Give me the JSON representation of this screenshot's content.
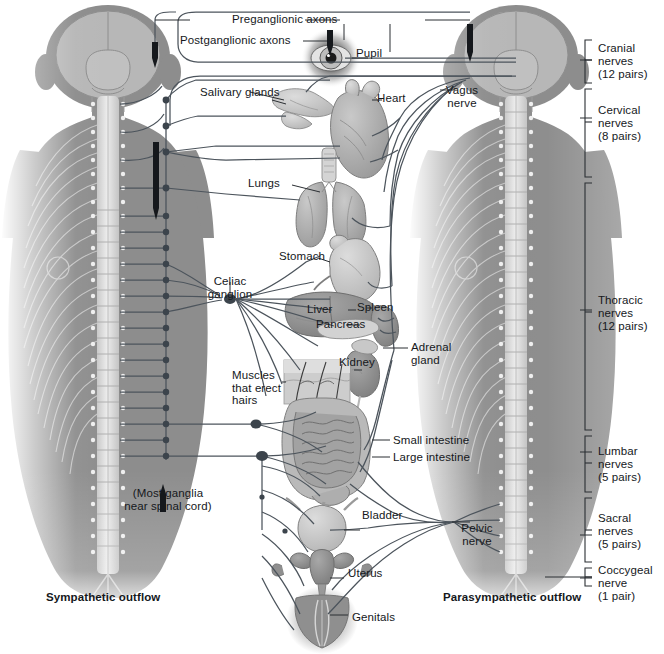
{
  "figure": {
    "title_left": "Sympathetic outflow",
    "title_right": "Parasympathetic outflow",
    "legend": {
      "preganglionic": "Preganglionic axons",
      "postganglionic": "Postganglionic axons"
    },
    "note_left": "(Most ganglia\nnear spinal cord)",
    "colors": {
      "body_fill": "#8d8d8d",
      "body_fill_light": "#b9b9b9",
      "brain_fill": "#b4b4b4",
      "cord_fill": "#d8d8d8",
      "nerve_line": "#4c545c",
      "ganglion_dot": "#3c444c",
      "organ_mid": "#a5a5a5",
      "organ_dark": "#8a8a8a",
      "organ_light": "#c6c6c6",
      "text": "#15181c",
      "background": "#ffffff"
    }
  },
  "organs": [
    {
      "id": "pupil",
      "label": "Pupil"
    },
    {
      "id": "salivary-glands",
      "label": "Salivary glands"
    },
    {
      "id": "heart",
      "label": "Heart"
    },
    {
      "id": "lungs",
      "label": "Lungs"
    },
    {
      "id": "stomach",
      "label": "Stomach"
    },
    {
      "id": "liver",
      "label": "Liver"
    },
    {
      "id": "spleen",
      "label": "Spleen"
    },
    {
      "id": "pancreas",
      "label": "Pancreas"
    },
    {
      "id": "kidney",
      "label": "Kidney"
    },
    {
      "id": "adrenal-gland",
      "label": "Adrenal\ngland"
    },
    {
      "id": "erector-muscles",
      "label": "Muscles\nthat erect\nhairs"
    },
    {
      "id": "small-intestine",
      "label": "Small intestine"
    },
    {
      "id": "large-intestine",
      "label": "Large intestine"
    },
    {
      "id": "bladder",
      "label": "Bladder"
    },
    {
      "id": "uterus",
      "label": "Uterus"
    },
    {
      "id": "genitals",
      "label": "Genitals"
    }
  ],
  "ganglia": [
    {
      "id": "celiac-ganglion",
      "label": "Celiac\nganglion"
    }
  ],
  "nerves": [
    {
      "id": "vagus-nerve",
      "label": "Vagus\nnerve"
    },
    {
      "id": "pelvic-nerve",
      "label": "Pelvic\nnerve"
    }
  ],
  "spinal_segments": [
    {
      "id": "cranial",
      "name": "Cranial",
      "line2": "nerves",
      "count": "(12 pairs)"
    },
    {
      "id": "cervical",
      "name": "Cervical",
      "line2": "nerves",
      "count": "(8 pairs)"
    },
    {
      "id": "thoracic",
      "name": "Thoracic",
      "line2": "nerves",
      "count": "(12 pairs)"
    },
    {
      "id": "lumbar",
      "name": "Lumbar",
      "line2": "nerves",
      "count": "(5 pairs)"
    },
    {
      "id": "sacral",
      "name": "Sacral",
      "line2": "nerves",
      "count": "(5 pairs)"
    },
    {
      "id": "coccygeal",
      "name": "Coccygeal",
      "line2": "nerve",
      "count": "(1 pair)"
    }
  ]
}
